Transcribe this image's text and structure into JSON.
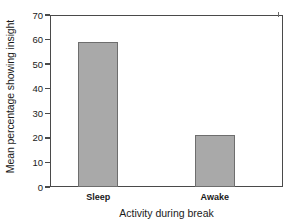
{
  "chart_data": {
    "type": "bar",
    "title": "",
    "subtitle": "",
    "categories": [
      "Sleep",
      "Awake"
    ],
    "values": [
      59,
      21
    ],
    "series": [
      {
        "name": "Mean percentage showing insight",
        "values": [
          59,
          21
        ]
      }
    ],
    "xlabel": "Activity during break",
    "ylabel": "Mean percentage showing insight",
    "ylim": [
      0,
      70
    ],
    "ytick_labels": [
      "0",
      "10",
      "20",
      "30",
      "40",
      "50",
      "60",
      "70"
    ],
    "ytick_values": [
      0,
      10,
      20,
      30,
      40,
      50,
      60,
      70
    ],
    "xtick_labels": [
      "Sleep",
      "Awake"
    ],
    "grid": false,
    "legend": false,
    "legend_position": "none",
    "annotations": [],
    "colors": {
      "bar_fill": "#a9a9a9",
      "bar_edge": "#6e6e6e",
      "axis": "#4a4a4a",
      "text": "#1a1a1a",
      "background": "#ffffff"
    }
  }
}
